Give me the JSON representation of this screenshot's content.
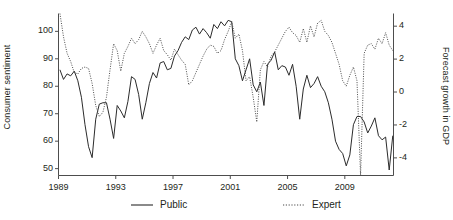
{
  "chart_data": {
    "type": "line",
    "title": "",
    "subtitle": "",
    "xlabel": "",
    "ylabel": "Consumer sentiment",
    "ylabel_right": "Forecast growth in GDP",
    "grid": false,
    "legend_position": "bottom",
    "xlim": [
      1989.0,
      2012.4
    ],
    "ylim": [
      47.5,
      106.5
    ],
    "ylim_right": [
      -5.07,
      4.77
    ],
    "xticks": [
      1989,
      1993,
      1997,
      2001,
      2005,
      2009
    ],
    "xtick_labels": [
      "1989",
      "1993",
      "1997",
      "2001",
      "2005",
      "2009"
    ],
    "yticks": [
      50,
      60,
      70,
      80,
      90,
      100
    ],
    "ytick_labels": [
      "50",
      "60",
      "70",
      "80",
      "90",
      "100"
    ],
    "yticks_right": [
      -4,
      -2,
      0,
      2,
      4
    ],
    "ytick_labels_right": [
      "-4",
      "-2",
      "0",
      "2",
      "4"
    ],
    "series": [
      {
        "name": "Public",
        "axis": "left",
        "style": "solid",
        "color": "#2b2b2b",
        "x": [
          1989.1,
          1989.35,
          1989.6,
          1989.85,
          1990.1,
          1990.35,
          1990.6,
          1990.85,
          1991.1,
          1991.35,
          1991.6,
          1991.85,
          1992.1,
          1992.35,
          1992.6,
          1992.85,
          1993.1,
          1993.35,
          1993.6,
          1993.85,
          1994.1,
          1994.35,
          1994.6,
          1994.85,
          1995.1,
          1995.35,
          1995.6,
          1995.85,
          1996.1,
          1996.35,
          1996.6,
          1996.85,
          1997.1,
          1997.35,
          1997.6,
          1997.85,
          1998.1,
          1998.35,
          1998.6,
          1998.85,
          1999.1,
          1999.35,
          1999.6,
          1999.85,
          2000.1,
          2000.35,
          2000.6,
          2000.85,
          2001.1,
          2001.35,
          2001.6,
          2001.85,
          2002.1,
          2002.35,
          2002.6,
          2002.85,
          2003.1,
          2003.35,
          2003.6,
          2003.85,
          2004.1,
          2004.35,
          2004.6,
          2004.85,
          2005.1,
          2005.35,
          2005.6,
          2005.85,
          2006.1,
          2006.35,
          2006.6,
          2006.85,
          2007.1,
          2007.35,
          2007.6,
          2007.85,
          2008.1,
          2008.35,
          2008.6,
          2008.85,
          2009.1,
          2009.35,
          2009.6,
          2009.85,
          2010.1,
          2010.35,
          2010.6,
          2010.85,
          2011.1,
          2011.35,
          2011.6,
          2011.85,
          2012.1,
          2012.35
        ],
        "values": [
          86.0,
          82.5,
          84.5,
          83.8,
          85.5,
          82.0,
          76.0,
          66.0,
          58.0,
          54.0,
          68.0,
          73.5,
          74.0,
          74.0,
          68.0,
          61.0,
          73.0,
          71.0,
          68.5,
          74.5,
          83.5,
          82.5,
          77.0,
          68.0,
          74.0,
          81.0,
          85.0,
          83.0,
          88.5,
          89.0,
          86.0,
          86.5,
          91.0,
          93.0,
          96.0,
          98.0,
          97.0,
          100.5,
          101.5,
          99.0,
          101.0,
          99.5,
          97.5,
          102.5,
          101.0,
          103.5,
          102.0,
          104.0,
          103.5,
          90.0,
          87.5,
          82.0,
          86.0,
          90.0,
          80.5,
          78.0,
          81.5,
          73.0,
          88.0,
          89.5,
          92.5,
          86.0,
          87.5,
          87.0,
          84.0,
          88.0,
          80.0,
          68.0,
          79.0,
          84.0,
          79.5,
          81.0,
          83.5,
          80.0,
          78.0,
          74.0,
          68.0,
          60.0,
          57.0,
          55.5,
          51.0,
          55.0,
          66.0,
          69.0,
          69.0,
          67.0,
          63.0,
          65.5,
          68.5,
          62.0,
          60.5,
          61.5,
          49.5,
          62.0
        ]
      },
      {
        "name": "Expert",
        "axis": "right",
        "style": "dotted",
        "color": "#4a4a4a",
        "x": [
          1989.1,
          1989.35,
          1989.6,
          1989.85,
          1990.1,
          1990.35,
          1990.6,
          1990.85,
          1991.1,
          1991.35,
          1991.6,
          1991.85,
          1992.1,
          1992.35,
          1992.6,
          1992.85,
          1993.1,
          1993.35,
          1993.6,
          1993.85,
          1994.1,
          1994.35,
          1994.6,
          1994.85,
          1995.1,
          1995.35,
          1995.6,
          1995.85,
          1996.1,
          1996.35,
          1996.6,
          1996.85,
          1997.1,
          1997.35,
          1997.6,
          1997.85,
          1998.1,
          1998.35,
          1998.6,
          1998.85,
          1999.1,
          1999.35,
          1999.6,
          1999.85,
          2000.1,
          2000.35,
          2000.6,
          2000.85,
          2001.1,
          2001.35,
          2001.6,
          2001.85,
          2002.1,
          2002.35,
          2002.6,
          2002.85,
          2003.1,
          2003.35,
          2003.6,
          2003.85,
          2004.1,
          2004.35,
          2004.6,
          2004.85,
          2005.1,
          2005.35,
          2005.6,
          2005.85,
          2006.1,
          2006.35,
          2006.6,
          2006.85,
          2007.1,
          2007.35,
          2007.6,
          2007.85,
          2008.1,
          2008.35,
          2008.6,
          2008.85,
          2009.1,
          2009.35,
          2009.6,
          2009.85,
          2010.1,
          2010.35,
          2010.6,
          2010.85,
          2011.1,
          2011.35,
          2011.6,
          2011.85,
          2012.1,
          2012.35
        ],
        "values_left_scale": [
          106.5,
          98.0,
          92.0,
          89.0,
          85.0,
          84.5,
          86.5,
          87.0,
          86.5,
          81.0,
          73.0,
          69.0,
          70.5,
          76.0,
          86.0,
          95.5,
          93.0,
          85.5,
          92.0,
          94.5,
          97.5,
          95.5,
          97.0,
          100.0,
          98.0,
          95.5,
          92.0,
          95.0,
          97.5,
          93.0,
          91.5,
          89.5,
          93.5,
          91.5,
          89.5,
          88.0,
          80.5,
          82.0,
          85.0,
          88.0,
          91.0,
          93.5,
          95.0,
          94.5,
          92.0,
          93.0,
          97.0,
          100.0,
          103.5,
          97.5,
          99.0,
          93.0,
          82.0,
          83.5,
          76.0,
          67.0,
          86.0,
          89.0,
          87.0,
          91.0,
          92.5,
          95.0,
          97.5,
          100.0,
          101.5,
          99.5,
          98.5,
          96.0,
          101.0,
          96.0,
          102.0,
          98.0,
          103.0,
          104.0,
          100.0,
          98.5,
          96.0,
          92.0,
          88.0,
          82.0,
          80.0,
          84.0,
          87.0,
          82.0,
          47.5,
          92.0,
          95.0,
          95.5,
          93.5,
          97.5,
          95.5,
          99.5,
          95.0,
          93.0
        ]
      }
    ]
  },
  "legend": {
    "items": [
      {
        "label": "Public",
        "style": "solid",
        "icon": "line-solid-icon"
      },
      {
        "label": "Expert",
        "style": "dotted",
        "icon": "line-dotted-icon"
      }
    ]
  },
  "axes": {
    "left_title": "Consumer sentiment",
    "right_title": "Forecast growth in GDP"
  }
}
